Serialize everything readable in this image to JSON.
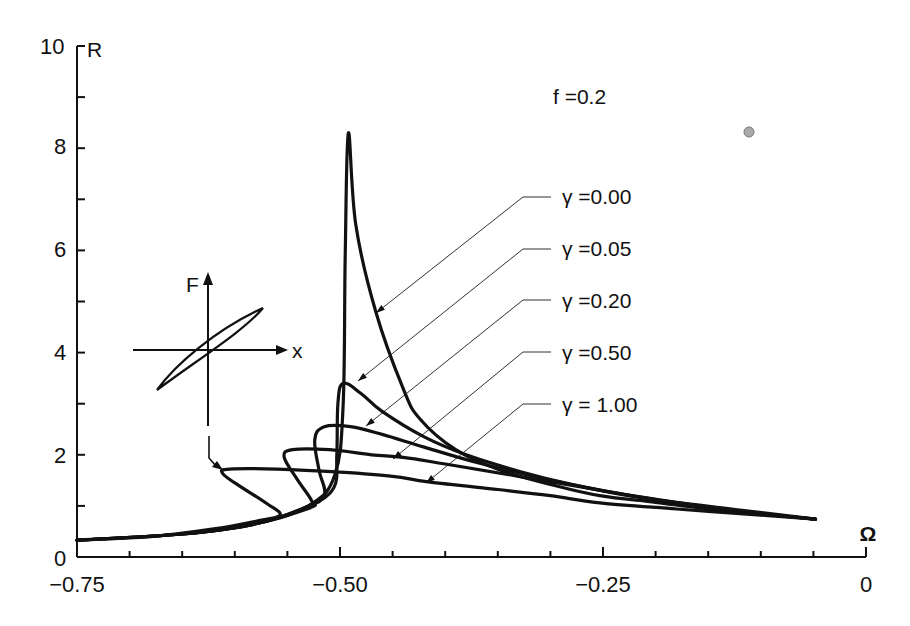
{
  "chart_data": {
    "type": "line",
    "title": "",
    "xlabel": "Ω",
    "ylabel": "R",
    "xlim": [
      -0.75,
      0
    ],
    "ylim": [
      0,
      10
    ],
    "x_ticks": [
      -0.75,
      -0.5,
      -0.25,
      0
    ],
    "x_tick_labels": [
      "-0.75",
      "-0.50",
      "-0.25",
      "0"
    ],
    "x_minor_step": 0.05,
    "y_ticks": [
      0,
      2,
      4,
      6,
      8,
      10
    ],
    "y_tick_labels": [
      "0",
      "2",
      "4",
      "6",
      "8",
      "10"
    ],
    "y_minor_step": 1,
    "grid": false,
    "legend_position": "annotations with leader lines (upper right)",
    "annotation": "f = 0.2",
    "parameter": "γ",
    "series": [
      {
        "name": "γ = 0.00",
        "peak": {
          "x": -0.492,
          "y": 8.3
        },
        "points": [
          [
            -0.75,
            0.33
          ],
          [
            -0.65,
            0.45
          ],
          [
            -0.58,
            0.65
          ],
          [
            -0.53,
            1.0
          ],
          [
            -0.505,
            1.6
          ],
          [
            -0.497,
            3.0
          ],
          [
            -0.495,
            6.0
          ],
          [
            -0.492,
            8.3
          ],
          [
            -0.485,
            6.5
          ],
          [
            -0.466,
            4.8
          ],
          [
            -0.44,
            3.3
          ],
          [
            -0.424,
            2.7
          ],
          [
            -0.39,
            2.1
          ],
          [
            -0.348,
            1.7
          ],
          [
            -0.3,
            1.42
          ],
          [
            -0.253,
            1.2
          ],
          [
            -0.2,
            1.07
          ],
          [
            -0.158,
            0.96
          ],
          [
            -0.1,
            0.84
          ],
          [
            -0.048,
            0.74
          ]
        ]
      },
      {
        "name": "γ = 0.05",
        "peak": {
          "x": -0.497,
          "y": 3.4
        },
        "points": [
          [
            -0.75,
            0.33
          ],
          [
            -0.65,
            0.45
          ],
          [
            -0.58,
            0.65
          ],
          [
            -0.53,
            1.0
          ],
          [
            -0.506,
            1.35
          ],
          [
            -0.503,
            2.0
          ],
          [
            -0.502,
            3.0
          ],
          [
            -0.497,
            3.4
          ],
          [
            -0.48,
            3.2
          ],
          [
            -0.46,
            2.85
          ],
          [
            -0.42,
            2.35
          ],
          [
            -0.38,
            2.0
          ],
          [
            -0.33,
            1.68
          ],
          [
            -0.28,
            1.42
          ],
          [
            -0.22,
            1.18
          ],
          [
            -0.15,
            0.98
          ],
          [
            -0.1,
            0.85
          ],
          [
            -0.048,
            0.74
          ]
        ]
      },
      {
        "name": "γ = 0.20",
        "peak": {
          "x": -0.515,
          "y": 2.55
        },
        "points": [
          [
            -0.75,
            0.33
          ],
          [
            -0.65,
            0.45
          ],
          [
            -0.58,
            0.65
          ],
          [
            -0.535,
            0.95
          ],
          [
            -0.515,
            1.2
          ],
          [
            -0.52,
            1.7
          ],
          [
            -0.524,
            2.3
          ],
          [
            -0.515,
            2.55
          ],
          [
            -0.49,
            2.55
          ],
          [
            -0.46,
            2.4
          ],
          [
            -0.42,
            2.15
          ],
          [
            -0.37,
            1.85
          ],
          [
            -0.31,
            1.55
          ],
          [
            -0.25,
            1.3
          ],
          [
            -0.18,
            1.06
          ],
          [
            -0.12,
            0.9
          ],
          [
            -0.048,
            0.74
          ]
        ]
      },
      {
        "name": "γ = 0.50",
        "peak": {
          "x": -0.545,
          "y": 2.1
        },
        "points": [
          [
            -0.75,
            0.33
          ],
          [
            -0.65,
            0.45
          ],
          [
            -0.59,
            0.62
          ],
          [
            -0.53,
            0.95
          ],
          [
            -0.527,
            1.1
          ],
          [
            -0.54,
            1.5
          ],
          [
            -0.553,
            1.95
          ],
          [
            -0.545,
            2.1
          ],
          [
            -0.51,
            2.1
          ],
          [
            -0.47,
            2.0
          ],
          [
            -0.44,
            1.95
          ],
          [
            -0.4,
            1.82
          ],
          [
            -0.33,
            1.58
          ],
          [
            -0.26,
            1.33
          ],
          [
            -0.19,
            1.1
          ],
          [
            -0.12,
            0.92
          ],
          [
            -0.048,
            0.74
          ]
        ]
      },
      {
        "name": "γ = 1.00",
        "peak": {
          "x": -0.609,
          "y": 1.72
        },
        "points": [
          [
            -0.75,
            0.33
          ],
          [
            -0.68,
            0.4
          ],
          [
            -0.62,
            0.55
          ],
          [
            -0.58,
            0.7
          ],
          [
            -0.557,
            0.82
          ],
          [
            -0.57,
            1.05
          ],
          [
            -0.6,
            1.45
          ],
          [
            -0.612,
            1.65
          ],
          [
            -0.605,
            1.72
          ],
          [
            -0.56,
            1.72
          ],
          [
            -0.5,
            1.66
          ],
          [
            -0.45,
            1.58
          ],
          [
            -0.416,
            1.47
          ],
          [
            -0.35,
            1.32
          ],
          [
            -0.3,
            1.2
          ],
          [
            -0.253,
            1.06
          ],
          [
            -0.18,
            0.94
          ],
          [
            -0.12,
            0.85
          ],
          [
            -0.048,
            0.74
          ]
        ]
      }
    ],
    "inset": {
      "description": "Hysteresis loop F vs x, arrow pointing to γ = 1.00 curve",
      "x_axis_label": "x",
      "y_axis_label": "F"
    }
  },
  "labels": {
    "y_axis": "R",
    "x_axis": "Ω",
    "f_annotation": "f =0.2",
    "gamma_labels": [
      "γ =0.00",
      "γ =0.05",
      "γ =0.20",
      "γ =0.50",
      "γ = 1.00"
    ],
    "inset_F": "F",
    "inset_x": "x",
    "x_tick_labels": [
      "−0.75",
      "−0.50",
      "−0.25",
      "0"
    ],
    "y_tick_labels": [
      "0",
      "2",
      "4",
      "6",
      "8",
      "10"
    ]
  }
}
